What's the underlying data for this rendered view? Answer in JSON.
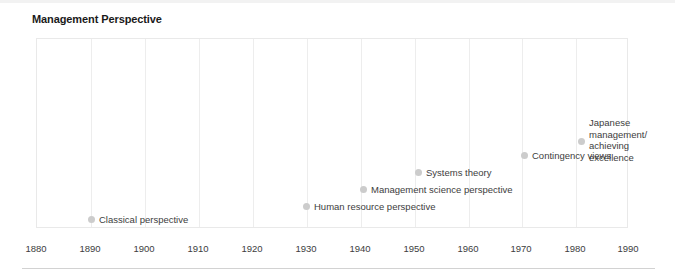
{
  "chart_data": {
    "type": "scatter",
    "title": "Management Perspective",
    "xlabel": "",
    "ylabel": "",
    "xlim": [
      1880,
      1990
    ],
    "xticks": [
      1880,
      1890,
      1900,
      1910,
      1920,
      1930,
      1940,
      1950,
      1960,
      1970,
      1980,
      1990
    ],
    "tick_labels": [
      "1880",
      "1890",
      "1900",
      "1910",
      "1920",
      "1930",
      "1940",
      "1950",
      "1960",
      "1970",
      "1980",
      "1990"
    ],
    "grid": "vertical",
    "legend": "none",
    "marker_color": "#cccccc",
    "label_color": "#3d3d3d",
    "points": [
      {
        "label": "Classical perspective",
        "lines": [
          "Classical perspective"
        ],
        "x": 1890,
        "px": 88,
        "py": 214,
        "align": "right"
      },
      {
        "label": "Human resource perspective",
        "lines": [
          "Human resource perspective"
        ],
        "x": 1930,
        "px": 303,
        "py": 201,
        "align": "right"
      },
      {
        "label": "Management science perspective",
        "lines": [
          "Management science perspective"
        ],
        "x": 1940,
        "px": 360,
        "py": 184,
        "align": "right"
      },
      {
        "label": "Systems theory",
        "lines": [
          "Systems theory"
        ],
        "x": 1950,
        "px": 415,
        "py": 167,
        "align": "right"
      },
      {
        "label": "Contingency views",
        "lines": [
          "Contingency views"
        ],
        "x": 1970,
        "px": 521,
        "py": 150,
        "align": "right"
      },
      {
        "label": "Japanese management/ achieving excellence",
        "lines": [
          "Japanese",
          "management/",
          "achieving",
          "excellence"
        ],
        "x": 1980,
        "px": 578,
        "py": 117,
        "align": "right"
      }
    ]
  },
  "axis": {
    "tick_positions_px": [
      36,
      90,
      144,
      198,
      252,
      306,
      360,
      414,
      468,
      521,
      575,
      628
    ]
  }
}
